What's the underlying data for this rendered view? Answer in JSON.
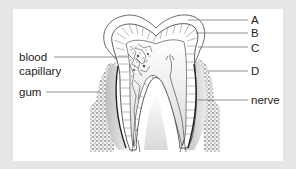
{
  "diagram": {
    "title": "",
    "labels": {
      "A": "A",
      "B": "B",
      "C": "C",
      "D": "D",
      "blood_capillary_line1": "blood",
      "blood_capillary_line2": "capillary",
      "gum": "gum",
      "nerve": "nerve"
    },
    "colors": {
      "background": "#e6e6e6",
      "panel": "#ffffff",
      "line": "#555555",
      "gum_fill": "#cfcfcf",
      "pulp_shade": "#d8d8d8"
    }
  }
}
